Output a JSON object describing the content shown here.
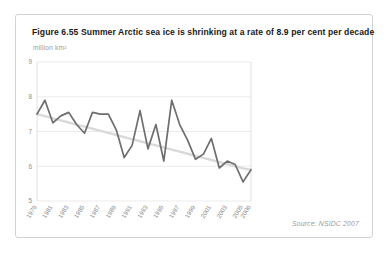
{
  "figure": {
    "title": "Figure 6.55 Summer Arctic sea ice is shrinking at a rate of 8.9 per cent per decade",
    "axis_unit_label": "million km²",
    "source": "Source: NSIDC 2007"
  },
  "chart_data": {
    "type": "line",
    "title": "Figure 6.55 Summer Arctic sea ice is shrinking at a rate of 8.9 per cent per decade",
    "xlabel": "",
    "ylabel": "million km²",
    "ylim": [
      5,
      9
    ],
    "xlim": [
      1979,
      2006
    ],
    "yticks": [
      9,
      8,
      7,
      6,
      5
    ],
    "ytick_labels": [
      "9",
      "8",
      "7",
      "6",
      "5"
    ],
    "grid": true,
    "legend": "none",
    "x": [
      1979,
      1980,
      1981,
      1982,
      1983,
      1984,
      1985,
      1986,
      1987,
      1988,
      1989,
      1990,
      1991,
      1992,
      1993,
      1994,
      1995,
      1996,
      1997,
      1998,
      1999,
      2000,
      2001,
      2002,
      2003,
      2004,
      2005,
      2006
    ],
    "xtick_labels": [
      "1979",
      "1981",
      "1983",
      "1985",
      "1987",
      "1989",
      "1991",
      "1993",
      "1995",
      "1997",
      "1999",
      "2001",
      "2003",
      "2005",
      "2006"
    ],
    "series": [
      {
        "name": "September Arctic sea ice extent",
        "color": "#6e6e6e",
        "values": [
          7.5,
          7.9,
          7.25,
          7.45,
          7.55,
          7.2,
          6.95,
          7.55,
          7.5,
          7.5,
          7.05,
          6.25,
          6.6,
          7.6,
          6.5,
          7.2,
          6.15,
          7.9,
          7.2,
          6.75,
          6.2,
          6.35,
          6.8,
          5.95,
          6.15,
          6.05,
          5.55,
          5.9
        ],
        "peak": {
          "year": 1996,
          "value": 7.9
        },
        "minimum": {
          "year": 2005,
          "value": 5.55
        }
      },
      {
        "name": "Linear trend",
        "color": "#d9d9d9",
        "type": "trendline",
        "values": [
          7.5,
          7.44,
          7.38,
          7.32,
          7.26,
          7.2,
          7.14,
          7.08,
          7.02,
          6.96,
          6.9,
          6.84,
          6.78,
          6.72,
          6.66,
          6.6,
          6.54,
          6.48,
          6.42,
          6.36,
          6.3,
          6.24,
          6.18,
          6.12,
          6.06,
          6.0,
          5.94,
          5.9
        ],
        "rate_per_decade_percent": 8.9
      }
    ]
  },
  "colors": {
    "series": "#6e6e6e",
    "trend": "#d9d9d9",
    "grid": "#e4e4e4",
    "card_border": "#d2d2d2",
    "muted_text": "#9a9a9a"
  }
}
